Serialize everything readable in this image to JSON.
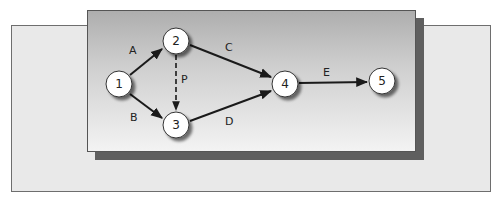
{
  "diagram": {
    "type": "activity-on-arrow network",
    "nodes": [
      {
        "id": "1",
        "label": "1",
        "x": 119,
        "y": 84
      },
      {
        "id": "2",
        "label": "2",
        "x": 176,
        "y": 41
      },
      {
        "id": "3",
        "label": "3",
        "x": 176,
        "y": 125
      },
      {
        "id": "4",
        "label": "4",
        "x": 285,
        "y": 84
      },
      {
        "id": "5",
        "label": "5",
        "x": 382,
        "y": 81
      }
    ],
    "edges": [
      {
        "id": "A",
        "label": "A",
        "from": "1",
        "to": "2",
        "style": "solid"
      },
      {
        "id": "B",
        "label": "B",
        "from": "1",
        "to": "3",
        "style": "solid"
      },
      {
        "id": "C",
        "label": "C",
        "from": "2",
        "to": "4",
        "style": "solid"
      },
      {
        "id": "D",
        "label": "D",
        "from": "3",
        "to": "4",
        "style": "solid"
      },
      {
        "id": "P",
        "label": "P",
        "from": "2",
        "to": "3",
        "style": "dashed"
      },
      {
        "id": "E",
        "label": "E",
        "from": "4",
        "to": "5",
        "style": "solid"
      }
    ]
  },
  "labels": {
    "node_1": "1",
    "node_2": "2",
    "node_3": "3",
    "node_4": "4",
    "node_5": "5",
    "edge_A": "A",
    "edge_B": "B",
    "edge_C": "C",
    "edge_D": "D",
    "edge_P": "P",
    "edge_E": "E"
  },
  "colors": {
    "back_panel": "#e9e9e9",
    "front_panel_top": "#aeaeae",
    "front_panel_bottom": "#f3f3f3",
    "shadow": "#5f5f5f",
    "line": "#1a1a1a",
    "node_fill": "#ffffff"
  }
}
